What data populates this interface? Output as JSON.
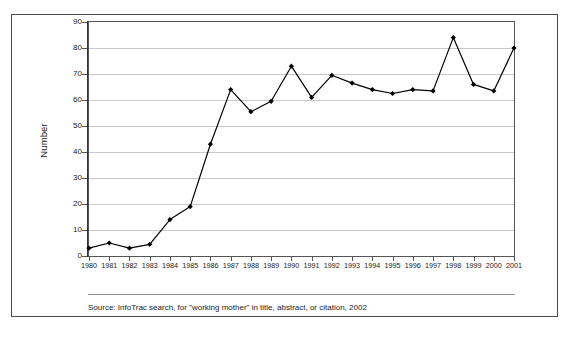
{
  "figure": {
    "source_note": "Source: InfoTrac search, for \"working mother\" in title, abstract, or citation, 2002"
  },
  "chart_data": {
    "type": "line",
    "title": "",
    "subtitle": "",
    "xlabel": "",
    "ylabel": "Number",
    "categories": [
      "1980",
      "1981",
      "1982",
      "1983",
      "1984",
      "1985",
      "1986",
      "1987",
      "1988",
      "1989",
      "1990",
      "1991",
      "1992",
      "1993",
      "1994",
      "1995",
      "1996",
      "1997",
      "1998",
      "1999",
      "2000",
      "2001"
    ],
    "values": [
      3,
      5,
      3,
      4.5,
      14,
      19,
      43,
      64,
      55.5,
      59.5,
      73,
      61,
      69.5,
      66.5,
      64,
      62.5,
      64,
      63.5,
      84,
      66,
      63.5,
      80
    ],
    "series": [
      {
        "name": "Number",
        "values": [
          3,
          5,
          3,
          4.5,
          14,
          19,
          43,
          64,
          55.5,
          59.5,
          73,
          61,
          69.5,
          66.5,
          64,
          62.5,
          64,
          63.5,
          84,
          66,
          63.5,
          80
        ]
      }
    ],
    "ylim": [
      0,
      90
    ],
    "ytick_labels": [
      "0",
      "10",
      "20",
      "30",
      "40",
      "50",
      "60",
      "70",
      "80",
      "90"
    ],
    "ytick_values": [
      0,
      10,
      20,
      30,
      40,
      50,
      60,
      70,
      80,
      90
    ],
    "grid": "horizontal",
    "legend": "none",
    "line_color": "#000000",
    "marker": "diamond",
    "marker_color": "#000000",
    "gridline_color": "#c8c8c8"
  }
}
